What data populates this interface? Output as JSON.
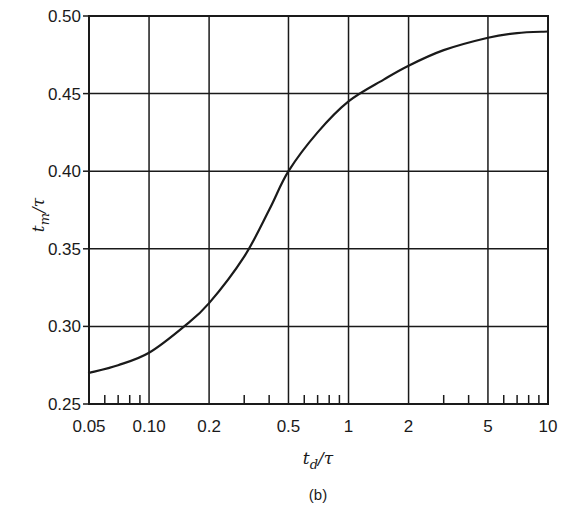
{
  "chart_data": {
    "type": "line",
    "title": "",
    "caption": "(b)",
    "xlabel": "t_d/τ",
    "xlabel_main": "t",
    "xlabel_sub": "d",
    "xlabel_rest": "/τ",
    "ylabel": "t_m/τ",
    "ylabel_main": "t",
    "ylabel_sub": "m",
    "ylabel_rest": "/τ",
    "xscale": "log",
    "xlim": [
      0.05,
      10
    ],
    "ylim": [
      0.25,
      0.5
    ],
    "grid": true,
    "legend": null,
    "x_ticks": [
      0.05,
      0.1,
      0.2,
      0.5,
      1,
      2,
      5,
      10
    ],
    "x_tick_labels": [
      "0.05",
      "0.10",
      "0.2",
      "0.5",
      "1",
      "2",
      "5",
      "10"
    ],
    "x_minor_ticks": [
      0.06,
      0.07,
      0.08,
      0.09,
      0.3,
      0.4,
      0.6,
      0.7,
      0.8,
      0.9,
      3,
      4,
      6,
      7,
      8,
      9
    ],
    "y_ticks": [
      0.25,
      0.3,
      0.35,
      0.4,
      0.45,
      0.5
    ],
    "y_tick_labels": [
      "0.25",
      "0.30",
      "0.35",
      "0.40",
      "0.45",
      "0.50"
    ],
    "series": [
      {
        "name": "t_m/τ vs t_d/τ",
        "x": [
          0.05,
          0.07,
          0.1,
          0.15,
          0.2,
          0.3,
          0.4,
          0.5,
          0.7,
          1,
          1.5,
          2,
          3,
          5,
          7,
          10
        ],
        "y": [
          0.27,
          0.275,
          0.283,
          0.3,
          0.315,
          0.345,
          0.375,
          0.4,
          0.425,
          0.445,
          0.459,
          0.468,
          0.478,
          0.486,
          0.489,
          0.49
        ]
      }
    ],
    "colors": {
      "line": "#1a1a1a",
      "grid": "#1a1a1a",
      "background": "#ffffff"
    }
  }
}
